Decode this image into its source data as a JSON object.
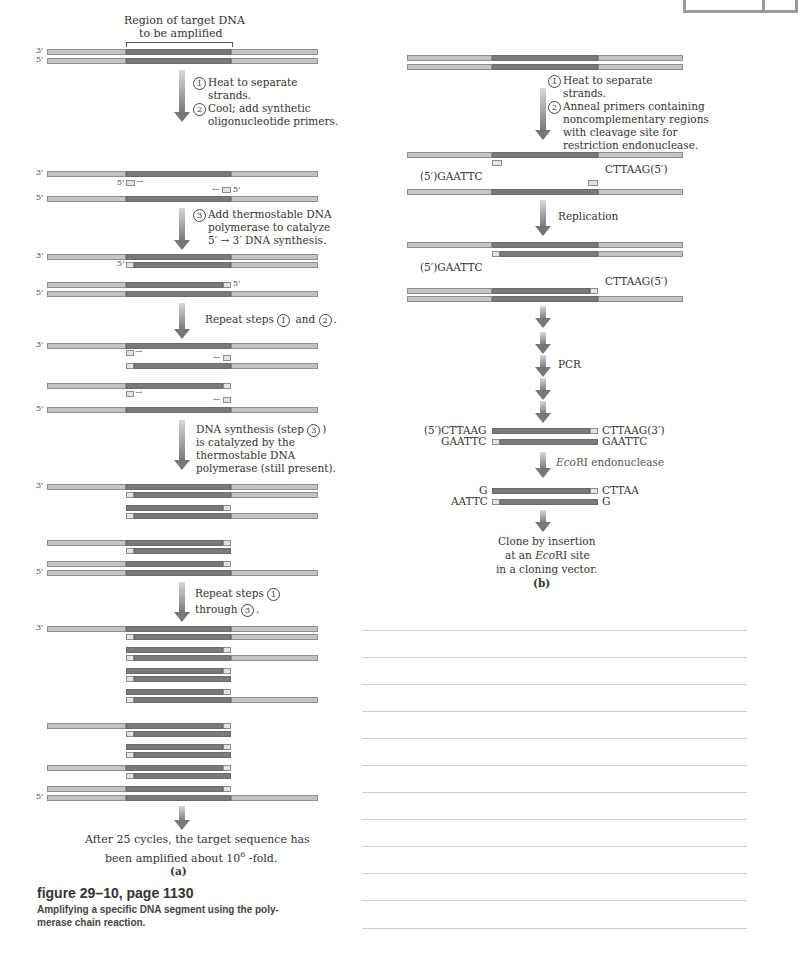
{
  "corner_box": {
    "present": true
  },
  "panel_a": {
    "header": "Region of target DNA",
    "header2": "to be amplified",
    "end_labels": {
      "three": "3'",
      "five": "5'"
    },
    "step1": {
      "num": "1",
      "text1": "Heat to separate",
      "text2": "strands."
    },
    "step2": {
      "num": "2",
      "text1": "Cool;  add synthetic",
      "text2": "oligonucleotide primers."
    },
    "step3": {
      "num": "3",
      "text1": "Add thermostable DNA",
      "text2": "polymerase to catalyze",
      "text3": "5′ → 3′ DNA synthesis."
    },
    "repeat12": {
      "pre": "Repeat steps",
      "n1": "1",
      "mid": "and",
      "n2": "2",
      "post": "."
    },
    "synth": {
      "line1a": "DNA synthesis (step",
      "n": "3",
      "line1b": ")",
      "line2": "is catalyzed by  the",
      "line3": "thermostable DNA",
      "line4": "polymerase (still present)."
    },
    "repeat13": {
      "pre": "Repeat steps",
      "n1": "1",
      "line2a": "through",
      "n2": "3",
      "post": "."
    },
    "result": {
      "line1": "After 25 cycles, the target sequence has",
      "line2a": "been amplified about 10",
      "sup": "6",
      "line2b": " -fold."
    },
    "label": "(a)"
  },
  "panel_b": {
    "step1": {
      "num": "1",
      "text1": "Heat to separate",
      "text2": "strands."
    },
    "step2": {
      "num": "2",
      "text1": "Anneal primers containing",
      "text2": "noncomplementary regions",
      "text3": "with cleavage site for",
      "text4": "restriction endonuclease."
    },
    "primer_left": "(5′)GAATTC",
    "primer_right": "CTTAAG(5′)",
    "replication": "Replication",
    "rep_left": "(5′)GAATTC",
    "rep_right": "CTTAAG(5′)",
    "pcr": "PCR",
    "prod_tl": "(5′)CTTAAG",
    "prod_tr": "CTTAAG(3′)",
    "prod_bl": "GAATTC",
    "prod_br": "GAATTC",
    "enzyme_italic": "Eco",
    "enzyme_rest": "RI endonuclease",
    "cut_tl": "G",
    "cut_tr": "CTTAA",
    "cut_bl": "AATTC",
    "cut_br": "G",
    "clone1": "Clone by insertion",
    "clone2a": "at an ",
    "clone2i": "Eco",
    "clone2b": "RI site",
    "clone3": "in a cloning vector.",
    "label": "(b)"
  },
  "caption": {
    "title": "figure 29–10, page 1130",
    "body1": "Amplifying a specific DNA segment using the poly-",
    "body2": "merase chain reaction."
  },
  "notes": {
    "line_count": 12
  }
}
